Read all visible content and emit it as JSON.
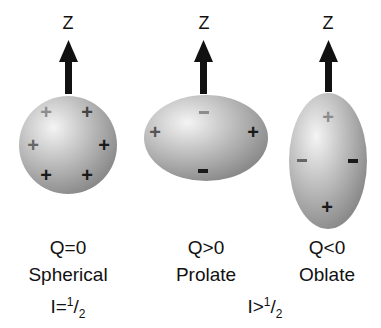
{
  "axis_label": "Z",
  "shapes": [
    {
      "id": "spherical",
      "q_label": "Q=0",
      "name": "Spherical",
      "charges": [
        "+",
        "+",
        "+",
        "+",
        "+",
        "+"
      ]
    },
    {
      "id": "prolate",
      "q_label": "Q>0",
      "name": "Prolate",
      "charges": [
        "-",
        "+",
        "+",
        "-"
      ]
    },
    {
      "id": "oblate",
      "q_label": "Q<0",
      "name": "Oblate",
      "charges": [
        "+",
        "-",
        "-",
        "+"
      ]
    }
  ],
  "spin_labels": {
    "half": {
      "prefix": "I=",
      "num": "1",
      "slash": "/",
      "den": "2"
    },
    "greater": {
      "prefix": "I>",
      "num": "1",
      "slash": "/",
      "den": "2"
    }
  },
  "colors": {
    "ellipsoid_light": "#f2f2f2",
    "ellipsoid_dark": "#8a8a8a",
    "arrow": "#111111",
    "charge_dark": "#1a1a1a",
    "charge_faint": "#8c8c8c"
  }
}
